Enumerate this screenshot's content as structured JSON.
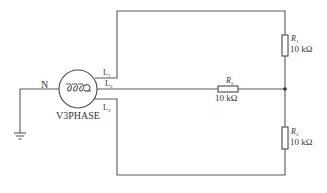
{
  "source": {
    "name": "V3PHASE",
    "neutral_label": "N",
    "line_labels": [
      "L1",
      "L2",
      "L3"
    ],
    "line_label_main": "L",
    "line_label_subs": [
      "1",
      "2",
      "3"
    ]
  },
  "resistors": [
    {
      "name": "R",
      "sub": "1",
      "value": "10 kΩ"
    },
    {
      "name": "R",
      "sub": "2",
      "value": "10 kΩ"
    },
    {
      "name": "R",
      "sub": "3",
      "value": "10 kΩ"
    }
  ],
  "colors": {
    "wire": "#5a5a5a",
    "text": "#333333",
    "background": "#ffffff"
  }
}
